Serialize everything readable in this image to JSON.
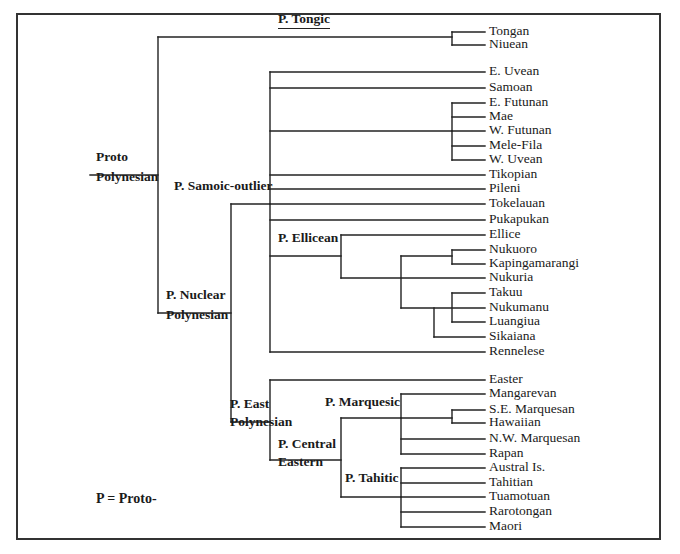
{
  "figure": {
    "legend": "P = Proto-",
    "line_color": "#222222",
    "frame": {
      "left": 16,
      "top": 13,
      "right": 661,
      "bottom": 540
    }
  },
  "nodes": [
    {
      "id": "proto",
      "lines": [
        "Proto",
        "Polynesian"
      ],
      "x": 96,
      "y": [
        160,
        180
      ]
    },
    {
      "id": "tongic",
      "lines": [
        "P. Tongic"
      ],
      "x": 278,
      "y": [
        22
      ],
      "underline": true
    },
    {
      "id": "samoic",
      "lines": [
        "P. Samoic-outlier"
      ],
      "x": 174,
      "y": [
        189
      ]
    },
    {
      "id": "nuclear",
      "lines": [
        "P. Nuclear",
        "Polynesian"
      ],
      "x": 166,
      "y": [
        298,
        318
      ]
    },
    {
      "id": "ellicean",
      "lines": [
        "P. Ellicean"
      ],
      "x": 278,
      "y": [
        241
      ]
    },
    {
      "id": "east",
      "lines": [
        "P. East",
        "Polynesian"
      ],
      "x": 230,
      "y": [
        407,
        425
      ]
    },
    {
      "id": "marquesic",
      "lines": [
        "P. Marquesic"
      ],
      "x": 325,
      "y": [
        405
      ]
    },
    {
      "id": "central",
      "lines": [
        "P. Central",
        "Eastern"
      ],
      "x": 278,
      "y": [
        447,
        465
      ]
    },
    {
      "id": "tahitic",
      "lines": [
        "P. Tahitic"
      ],
      "x": 345,
      "y": [
        481
      ]
    }
  ],
  "leaves": [
    {
      "name": "Tongan",
      "y": 32
    },
    {
      "name": "Niuean",
      "y": 45
    },
    {
      "name": "E. Uvean",
      "y": 72
    },
    {
      "name": "Samoan",
      "y": 88
    },
    {
      "name": "E. Futunan",
      "y": 103
    },
    {
      "name": "Mae",
      "y": 117
    },
    {
      "name": "W. Futunan",
      "y": 131
    },
    {
      "name": "Mele-Fila",
      "y": 146
    },
    {
      "name": "W. Uvean",
      "y": 160
    },
    {
      "name": "Tikopian",
      "y": 175
    },
    {
      "name": "Pileni",
      "y": 189
    },
    {
      "name": "Tokelauan",
      "y": 204
    },
    {
      "name": "Pukapukan",
      "y": 220
    },
    {
      "name": "Ellice",
      "y": 235
    },
    {
      "name": "Nukuoro",
      "y": 250
    },
    {
      "name": "Kapingamarangi",
      "y": 264
    },
    {
      "name": "Nukuria",
      "y": 278
    },
    {
      "name": "Takuu",
      "y": 293
    },
    {
      "name": "Nukumanu",
      "y": 308
    },
    {
      "name": "Luangiua",
      "y": 322
    },
    {
      "name": "Sikaiana",
      "y": 337
    },
    {
      "name": "Rennelese",
      "y": 352
    },
    {
      "name": "Easter",
      "y": 380
    },
    {
      "name": "Mangarevan",
      "y": 394
    },
    {
      "name": "S.E. Marquesan",
      "y": 410
    },
    {
      "name": "Hawaiian",
      "y": 423
    },
    {
      "name": "N.W. Marquesan",
      "y": 439
    },
    {
      "name": "Rapan",
      "y": 454
    },
    {
      "name": "Austral Is.",
      "y": 468
    },
    {
      "name": "Tahitian",
      "y": 483
    },
    {
      "name": "Tuamotuan",
      "y": 497
    },
    {
      "name": "Rarotongan",
      "y": 512
    },
    {
      "name": "Maori",
      "y": 527
    }
  ],
  "leaf_label_x": 489,
  "segments": [
    [
      90,
      175,
      158,
      175
    ],
    [
      158,
      37,
      158,
      313
    ],
    [
      158,
      37,
      452,
      37
    ],
    [
      452,
      32,
      452,
      45
    ],
    [
      452,
      32,
      485,
      32
    ],
    [
      452,
      45,
      485,
      45
    ],
    [
      158,
      313,
      231,
      313
    ],
    [
      231,
      204,
      231,
      422
    ],
    [
      231,
      204,
      270,
      204
    ],
    [
      270,
      72,
      270,
      352
    ],
    [
      270,
      72,
      485,
      72
    ],
    [
      270,
      88,
      485,
      88
    ],
    [
      270,
      131,
      452,
      131
    ],
    [
      452,
      103,
      452,
      160
    ],
    [
      452,
      103,
      485,
      103
    ],
    [
      452,
      117,
      485,
      117
    ],
    [
      452,
      131,
      485,
      131
    ],
    [
      452,
      146,
      485,
      146
    ],
    [
      452,
      160,
      485,
      160
    ],
    [
      270,
      175,
      485,
      175
    ],
    [
      270,
      189,
      485,
      189
    ],
    [
      270,
      204,
      485,
      204
    ],
    [
      270,
      220,
      485,
      220
    ],
    [
      270,
      256,
      341,
      256
    ],
    [
      341,
      235,
      341,
      278
    ],
    [
      341,
      235,
      485,
      235
    ],
    [
      341,
      278,
      485,
      278
    ],
    [
      401,
      256,
      401,
      308
    ],
    [
      401,
      256,
      452,
      256
    ],
    [
      452,
      250,
      452,
      264
    ],
    [
      452,
      250,
      485,
      250
    ],
    [
      452,
      264,
      485,
      264
    ],
    [
      401,
      308,
      485,
      308
    ],
    [
      452,
      293,
      452,
      322
    ],
    [
      452,
      293,
      485,
      293
    ],
    [
      452,
      322,
      485,
      322
    ],
    [
      434,
      308,
      434,
      337
    ],
    [
      434,
      337,
      485,
      337
    ],
    [
      270,
      352,
      485,
      352
    ],
    [
      231,
      422,
      270,
      422
    ],
    [
      270,
      380,
      270,
      460
    ],
    [
      270,
      380,
      485,
      380
    ],
    [
      270,
      460,
      341,
      460
    ],
    [
      341,
      418,
      341,
      497
    ],
    [
      341,
      418,
      401,
      418
    ],
    [
      401,
      394,
      401,
      454
    ],
    [
      401,
      394,
      485,
      394
    ],
    [
      401,
      418,
      452,
      418
    ],
    [
      452,
      410,
      452,
      423
    ],
    [
      452,
      410,
      485,
      410
    ],
    [
      452,
      423,
      485,
      423
    ],
    [
      401,
      439,
      485,
      439
    ],
    [
      401,
      454,
      485,
      454
    ],
    [
      341,
      497,
      401,
      497
    ],
    [
      401,
      468,
      401,
      527
    ],
    [
      401,
      468,
      485,
      468
    ],
    [
      401,
      483,
      485,
      483
    ],
    [
      401,
      497,
      485,
      497
    ],
    [
      401,
      512,
      485,
      512
    ],
    [
      401,
      527,
      485,
      527
    ]
  ]
}
